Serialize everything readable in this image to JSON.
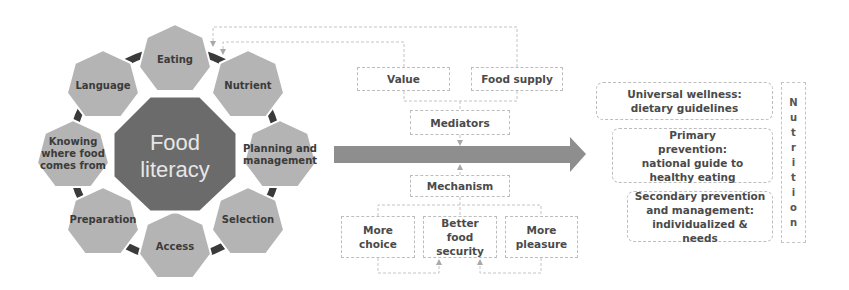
{
  "food_literacy": {
    "center_label_line1": "Food",
    "center_label_line2": "literacy",
    "components": [
      {
        "label": "Eating"
      },
      {
        "label": "Nutrient"
      },
      {
        "label": "Planning and management"
      },
      {
        "label": "Selection"
      },
      {
        "label": "Access"
      },
      {
        "label": "Preparation"
      },
      {
        "label": "Knowing where food comes from"
      },
      {
        "label": "Language"
      }
    ]
  },
  "mediators": {
    "inputs": [
      {
        "label": "Value"
      },
      {
        "label": "Food supply"
      }
    ],
    "label": "Mediators"
  },
  "mechanism": {
    "label": "Mechanism",
    "outputs": [
      {
        "label": "More choice"
      },
      {
        "label": "Better food security"
      },
      {
        "label": "More pleasure"
      }
    ]
  },
  "outcomes": {
    "levels": [
      {
        "label": "Universal wellness: dietary guidelines"
      },
      {
        "label": "Primary prevention: national guide to healthy eating"
      },
      {
        "label": "Secondary prevention and management: individualized & needs"
      }
    ],
    "side_label": "Nutrition",
    "side_letters": [
      "N",
      "u",
      "t",
      "r",
      "i",
      "t",
      "i",
      "o",
      "n"
    ]
  },
  "colors": {
    "center": "#6b6b6b",
    "satellite": "#b4b4b4",
    "connector": "#3a3a3a",
    "arrow": "#8e8e8e",
    "dashed": "#bdbdbd"
  }
}
